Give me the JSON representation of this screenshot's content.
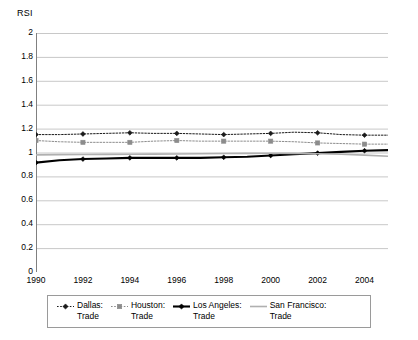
{
  "chart_data": {
    "type": "line",
    "title": "",
    "subtitle": "",
    "xlabel": "",
    "ylabel": "RSI",
    "ylim": [
      0,
      2
    ],
    "xlim": [
      1990,
      2005
    ],
    "grid": true,
    "legend_position": "bottom",
    "y_ticks": [
      "0",
      "0.2",
      "0.4",
      "0.6",
      "0.8",
      "1",
      "1.2",
      "1.4",
      "1.6",
      "1.8",
      "2"
    ],
    "y_tick_values": [
      0,
      0.2,
      0.4,
      0.6,
      0.8,
      1.0,
      1.2,
      1.4,
      1.6,
      1.8,
      2.0
    ],
    "x_ticks": [
      "1990",
      "1992",
      "1994",
      "1996",
      "1998",
      "2000",
      "2002",
      "2004"
    ],
    "x_tick_values": [
      1990,
      1992,
      1994,
      1996,
      1998,
      2000,
      2002,
      2004
    ],
    "x": [
      1990,
      1991,
      1992,
      1993,
      1994,
      1995,
      1996,
      1997,
      1998,
      1999,
      2000,
      2001,
      2002,
      2003,
      2004,
      2005
    ],
    "series": [
      {
        "name": "Dallas: Trade",
        "label_line1": "Dallas:",
        "label_line2": "Trade",
        "color": "#1a1a1a",
        "style": "dotted",
        "marker": "diamond",
        "values": [
          1.15,
          1.15,
          1.155,
          1.16,
          1.165,
          1.16,
          1.16,
          1.155,
          1.15,
          1.155,
          1.16,
          1.17,
          1.165,
          1.15,
          1.145,
          1.145
        ]
      },
      {
        "name": "Houston: Trade",
        "label_line1": "Houston:",
        "label_line2": "Trade",
        "color": "#8c8c8c",
        "style": "dotted",
        "marker": "square",
        "values": [
          1.1,
          1.09,
          1.085,
          1.085,
          1.085,
          1.095,
          1.1,
          1.095,
          1.095,
          1.095,
          1.095,
          1.09,
          1.08,
          1.075,
          1.07,
          1.07
        ]
      },
      {
        "name": "Los Angeles: Trade",
        "label_line1": "Los Angeles:",
        "label_line2": "Trade",
        "color": "#000000",
        "style": "solid-thick",
        "marker": "diamond",
        "values": [
          0.915,
          0.935,
          0.945,
          0.95,
          0.955,
          0.955,
          0.955,
          0.955,
          0.96,
          0.965,
          0.975,
          0.985,
          0.995,
          1.005,
          1.015,
          1.02
        ]
      },
      {
        "name": "San Francisco: Trade",
        "label_line1": "San Francisco:",
        "label_line2": "Trade",
        "color": "#b0b0b0",
        "style": "solid",
        "marker": "none",
        "values": [
          0.98,
          0.982,
          0.983,
          0.984,
          0.985,
          0.986,
          0.988,
          0.99,
          0.992,
          0.993,
          0.994,
          0.993,
          0.99,
          0.985,
          0.978,
          0.968
        ]
      }
    ]
  },
  "axis": {
    "unit_label": "RSI"
  },
  "colors": {
    "grid": "#c8c8c8",
    "axis": "#808080",
    "plot_background": "#ffffff",
    "legend_border": "#9a9a9a"
  }
}
